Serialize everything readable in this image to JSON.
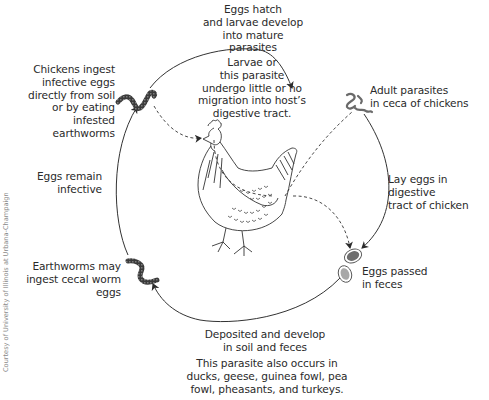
{
  "diagram": {
    "stages": [
      {
        "id": "hatch",
        "label": "Eggs hatch\nand larvae develop\ninto mature parasites"
      },
      {
        "id": "migration",
        "label": "Larvae or\nthis parasite\nundergo little or no\nmigration into host’s\ndigestive tract."
      },
      {
        "id": "adult",
        "label": "Adult parasites\nin ceca of chickens"
      },
      {
        "id": "lay",
        "label": "Lay eggs in digestive\ntract of chicken"
      },
      {
        "id": "passed",
        "label": "Eggs passed\nin feces"
      },
      {
        "id": "deposited",
        "label": "Deposited and develop\nin soil and feces"
      },
      {
        "id": "hosts",
        "label": "This parasite also occurs in\nducks, geese, guinea fowl, pea\nfowl, pheasants, and turkeys."
      },
      {
        "id": "earthworm",
        "label": "Earthworms may\ningest cecal worm\neggs"
      },
      {
        "id": "remain",
        "label": "Eggs remain\ninfective"
      },
      {
        "id": "ingest",
        "label": "Chickens ingest\ninfective eggs\ndirectly from soil\nor by eating infested\nearthworms"
      }
    ],
    "credit": "Courtesy of University of Illinois at Urbana-Champaign",
    "icons": [
      "earthworm-icon",
      "adult-parasite-icon",
      "egg-icon",
      "chicken-illustration"
    ],
    "colors": {
      "line": "#333333",
      "worm": "#3a3a3a",
      "parasite": "#666666",
      "egg_dark": "#6e6e6e",
      "egg_light": "#a8a8a8"
    }
  }
}
